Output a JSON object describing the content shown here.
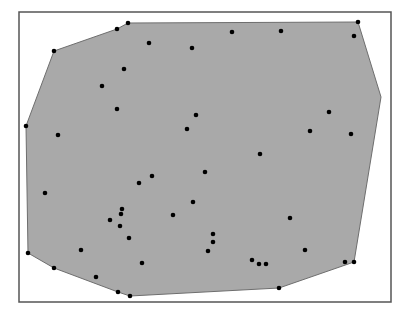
{
  "chart_data": {
    "type": "scatter",
    "title": "",
    "subtitle": "",
    "xlabel": "",
    "ylabel": "",
    "grid": false,
    "legend": null,
    "frame": {
      "x": 19,
      "y": 12,
      "width": 372,
      "height": 290,
      "stroke": "#555555"
    },
    "hull_fill": "#a9a9a9",
    "hull_stroke": "#6e6e6e",
    "point_color": "#000000",
    "point_radius": 2.3,
    "hull": [
      [
        128,
        23
      ],
      [
        358,
        22
      ],
      [
        381,
        97
      ],
      [
        354,
        262
      ],
      [
        279,
        288
      ],
      [
        130,
        296
      ],
      [
        118,
        292
      ],
      [
        54,
        268
      ],
      [
        28,
        253
      ],
      [
        26,
        126
      ],
      [
        54,
        51
      ],
      [
        117,
        29
      ]
    ],
    "points": [
      [
        128,
        23
      ],
      [
        117,
        29
      ],
      [
        54,
        51
      ],
      [
        149,
        43
      ],
      [
        192,
        48
      ],
      [
        232,
        32
      ],
      [
        281,
        31
      ],
      [
        358,
        22
      ],
      [
        354,
        36
      ],
      [
        124,
        69
      ],
      [
        102,
        86
      ],
      [
        117,
        109
      ],
      [
        26,
        126
      ],
      [
        58,
        135
      ],
      [
        196,
        115
      ],
      [
        187,
        129
      ],
      [
        329,
        112
      ],
      [
        310,
        131
      ],
      [
        351,
        134
      ],
      [
        260,
        154
      ],
      [
        205,
        172
      ],
      [
        152,
        176
      ],
      [
        139,
        183
      ],
      [
        45,
        193
      ],
      [
        122,
        209
      ],
      [
        121,
        214
      ],
      [
        110,
        220
      ],
      [
        193,
        202
      ],
      [
        173,
        215
      ],
      [
        120,
        226
      ],
      [
        290,
        218
      ],
      [
        129,
        238
      ],
      [
        213,
        234
      ],
      [
        213,
        242
      ],
      [
        208,
        251
      ],
      [
        81,
        250
      ],
      [
        305,
        250
      ],
      [
        142,
        263
      ],
      [
        252,
        260
      ],
      [
        259,
        264
      ],
      [
        266,
        264
      ],
      [
        345,
        262
      ],
      [
        354,
        262
      ],
      [
        28,
        253
      ],
      [
        54,
        268
      ],
      [
        96,
        277
      ],
      [
        118,
        292
      ],
      [
        130,
        296
      ],
      [
        279,
        288
      ]
    ]
  }
}
